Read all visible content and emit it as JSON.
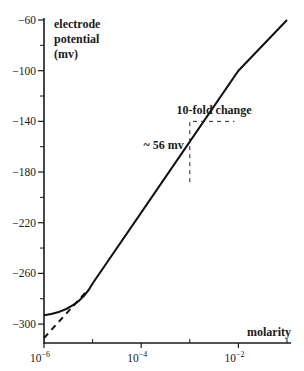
{
  "chart_data": {
    "type": "line",
    "title": "",
    "xlabel": "molarity",
    "ylabel": "electrode potential (mv)",
    "ylabel_lines": [
      "electrode",
      "potential",
      "(mv)"
    ],
    "x_scale": "log",
    "xlim": [
      1e-06,
      0.1
    ],
    "ylim": [
      -310,
      -60
    ],
    "y_ticks": [
      -60,
      -100,
      -140,
      -180,
      -220,
      -260,
      -300
    ],
    "y_tick_labels": [
      "-60",
      "-100",
      "-140",
      "-180",
      "-220",
      "-260",
      "-300"
    ],
    "y_minor_ticks": [
      -80,
      -120,
      -160,
      -200,
      -240,
      -280
    ],
    "x_ticks": [
      1e-06,
      0.0001,
      0.01
    ],
    "x_tick_labels": [
      {
        "base": "10",
        "exp": "-6"
      },
      {
        "base": "10",
        "exp": "-4"
      },
      {
        "base": "10",
        "exp": "-2"
      }
    ],
    "x_minor_ticks": [
      1e-05,
      0.001,
      0.1
    ],
    "grid": false,
    "series": [
      {
        "name": "measured electrode potential",
        "style": "solid",
        "x": [
          1e-06,
          2e-06,
          5e-06,
          1e-05,
          0.0001,
          0.001,
          0.01,
          0.1
        ],
        "values": [
          -293,
          -288,
          -280,
          -268,
          -212,
          -156,
          -100,
          -60
        ]
      },
      {
        "name": "ideal Nernstian extrapolation",
        "style": "dashed",
        "x": [
          1e-06,
          8e-06
        ],
        "values": [
          -311,
          -273
        ]
      }
    ],
    "annotations": [
      {
        "text": "10-fold change",
        "type": "horizontal dashed segment",
        "x_range": [
          0.001,
          0.01
        ],
        "y": -140
      },
      {
        "text": "~ 56 mv",
        "type": "vertical dashed segment",
        "x": 0.001,
        "y_range": [
          -188,
          -140
        ]
      }
    ],
    "legend": null
  }
}
